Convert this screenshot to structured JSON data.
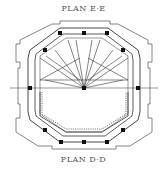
{
  "drawing": {
    "title_top": "PLAN E·E",
    "title_bottom": "PLAN D·D",
    "type": "architectural-plan",
    "shape": "octagonal-tower",
    "line_color": "#222222",
    "label_color": "#555555"
  }
}
